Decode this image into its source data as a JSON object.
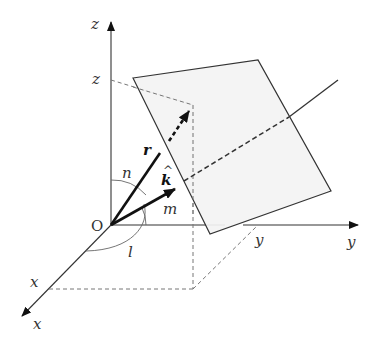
{
  "diagram": {
    "labels": {
      "z_axis": "z",
      "z_tick": "z",
      "y_axis": "y",
      "y_tick": "y",
      "x_axis": "x",
      "x_tick": "x",
      "origin": "O",
      "position_vector": "r",
      "unit_normal": "k",
      "unit_normal_hat": "^",
      "angle_x": "l",
      "angle_y": "m",
      "angle_z": "n"
    },
    "colors": {
      "line": "#333333",
      "plane_fill": "#f3f3f3",
      "dashed": "#777777",
      "vector": "#111111"
    }
  }
}
